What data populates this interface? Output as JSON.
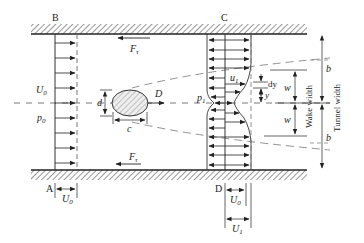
{
  "diagram": {
    "sections": {
      "upstream_top": "B",
      "upstream_bottom": "A",
      "downstream_top": "C",
      "downstream_bottom": "D"
    },
    "forces": {
      "top_wall_shear": "F",
      "top_wall_shear_sub": "τ",
      "bottom_wall_shear": "F",
      "bottom_wall_shear_sub": "τ",
      "drag": "D"
    },
    "upstream": {
      "velocity": "U",
      "velocity_sub": "0",
      "pressure": "p",
      "pressure_sub": "0"
    },
    "downstream": {
      "pressure": "p",
      "pressure_sub": "1",
      "wake_velocity": "u",
      "wake_velocity_sub": "1"
    },
    "body": {
      "height_label": "d",
      "chord_label": "c"
    },
    "dimensions": {
      "dy": "dy",
      "y": "y",
      "half_wake": "w",
      "outer_region": "b",
      "wake_width": "Wake width",
      "tunnel_width": "Tunnel width"
    },
    "bottom_scales": {
      "a_label_var": "U",
      "a_label_sub": "0",
      "d_label_u0_var": "U",
      "d_label_u0_sub": "0",
      "d_label_u1_var": "U",
      "d_label_u1_sub": "1"
    },
    "colors": {
      "line": "#333333",
      "dash": "#777777",
      "hatch": "#444444",
      "body_fill": "#e6e6e6"
    }
  }
}
